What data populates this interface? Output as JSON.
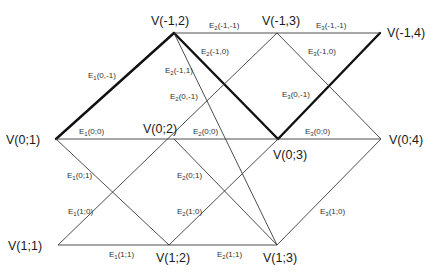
{
  "diagram": {
    "type": "lattice-graph",
    "vertices": [
      {
        "id": "v_m1_2",
        "label": "V(-1,2)",
        "x": 174,
        "y": 33,
        "lx": 151,
        "ly": 25
      },
      {
        "id": "v_m1_3",
        "label": "V(-1,3)",
        "x": 277,
        "y": 33,
        "lx": 262,
        "ly": 25
      },
      {
        "id": "v_m1_4",
        "label": "V(-1,4)",
        "x": 380,
        "y": 33,
        "lx": 387,
        "ly": 37
      },
      {
        "id": "v_0_1",
        "label": "V(0;1)",
        "x": 56,
        "y": 139,
        "lx": 6,
        "ly": 144
      },
      {
        "id": "v_0_2",
        "label": "V(0;2)",
        "x": 174,
        "y": 139,
        "lx": 143,
        "ly": 133
      },
      {
        "id": "v_0_3",
        "label": "V(0;3)",
        "x": 278,
        "y": 139,
        "lx": 273,
        "ly": 159
      },
      {
        "id": "v_0_4",
        "label": "V(0;4)",
        "x": 381,
        "y": 139,
        "lx": 389,
        "ly": 144
      },
      {
        "id": "v_1_1",
        "label": "V(1;1)",
        "x": 58,
        "y": 245,
        "lx": 8,
        "ly": 250
      },
      {
        "id": "v_1_2",
        "label": "V(1;2)",
        "x": 169,
        "y": 245,
        "lx": 156,
        "ly": 262
      },
      {
        "id": "v_1_3",
        "label": "V(1;3)",
        "x": 277,
        "y": 245,
        "lx": 263,
        "ly": 262
      }
    ],
    "edges": [
      {
        "from": "v_0_1",
        "to": "v_m1_2",
        "weight": "thick"
      },
      {
        "from": "v_m1_2",
        "to": "v_0_3",
        "weight": "thick"
      },
      {
        "from": "v_0_3",
        "to": "v_m1_4",
        "weight": "thick"
      },
      {
        "from": "v_m1_2",
        "to": "v_m1_4",
        "weight": "thin"
      },
      {
        "from": "v_0_1",
        "to": "v_0_4",
        "weight": "thin"
      },
      {
        "from": "v_1_1",
        "to": "v_1_3",
        "weight": "thin"
      },
      {
        "from": "v_m1_2",
        "to": "v_1_3",
        "weight": "thin"
      },
      {
        "from": "v_1_1",
        "to": "v_m1_3",
        "weight": "thin"
      },
      {
        "from": "v_0_1",
        "to": "v_1_2",
        "weight": "thin"
      },
      {
        "from": "v_1_2",
        "to": "v_0_3",
        "weight": "thin"
      },
      {
        "from": "v_0_2",
        "to": "v_1_3",
        "weight": "thin"
      },
      {
        "from": "v_m1_3",
        "to": "v_0_4",
        "weight": "thin"
      },
      {
        "from": "v_1_3",
        "to": "v_0_4",
        "weight": "thin"
      }
    ],
    "edge_labels": [
      {
        "base": "E",
        "sub": "1",
        "args": "(0,-1)",
        "x": 88,
        "y": 78
      },
      {
        "base": "E",
        "sub": "1",
        "args": "(0;0)",
        "x": 79,
        "y": 134
      },
      {
        "base": "E",
        "sub": "1",
        "args": "(0;1)",
        "x": 67,
        "y": 178
      },
      {
        "base": "E",
        "sub": "1",
        "args": "(1;0)",
        "x": 68,
        "y": 214
      },
      {
        "base": "E",
        "sub": "1",
        "args": "(1;1)",
        "x": 109,
        "y": 257
      },
      {
        "base": "E",
        "sub": "2",
        "args": "(-1,-1)",
        "x": 209,
        "y": 28
      },
      {
        "base": "E",
        "sub": "2",
        "args": "(-1,0)",
        "x": 201,
        "y": 54
      },
      {
        "base": "E",
        "sub": "2",
        "args": "(-1,1)",
        "x": 165,
        "y": 73
      },
      {
        "base": "E",
        "sub": "2",
        "args": "(0,-1)",
        "x": 170,
        "y": 99
      },
      {
        "base": "E",
        "sub": "2",
        "args": "(0;0)",
        "x": 193,
        "y": 134
      },
      {
        "base": "E",
        "sub": "2",
        "args": "(0;1)",
        "x": 177,
        "y": 178
      },
      {
        "base": "E",
        "sub": "2",
        "args": "(1;0)",
        "x": 177,
        "y": 214
      },
      {
        "base": "E",
        "sub": "2",
        "args": "(1;1)",
        "x": 217,
        "y": 257
      },
      {
        "base": "E",
        "sub": "3",
        "args": "(-1,-1)",
        "x": 316,
        "y": 28
      },
      {
        "base": "E",
        "sub": "3",
        "args": "(-1,0)",
        "x": 308,
        "y": 54
      },
      {
        "base": "E",
        "sub": "3",
        "args": "(0,-1)",
        "x": 282,
        "y": 97
      },
      {
        "base": "E",
        "sub": "3",
        "args": "(0;0)",
        "x": 305,
        "y": 134
      },
      {
        "base": "E",
        "sub": "3",
        "args": "(1;0)",
        "x": 320,
        "y": 214
      }
    ]
  }
}
